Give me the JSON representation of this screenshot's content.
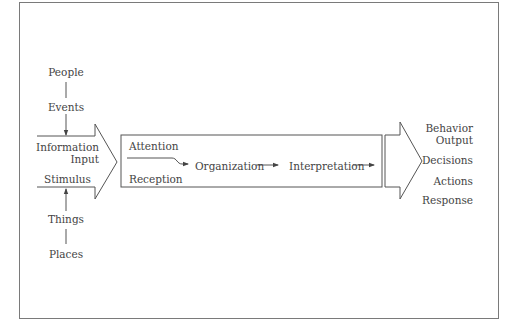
{
  "diagram": {
    "type": "perception-process-flow",
    "inputs": {
      "top_sources": [
        "People",
        "Events"
      ],
      "bottom_sources": [
        "Things",
        "Places"
      ],
      "arrow_labels": [
        "Information",
        "Input",
        "Stimulus"
      ]
    },
    "process": {
      "stages": [
        "Attention",
        "Reception",
        "Organization",
        "Interpretation"
      ]
    },
    "outputs": {
      "labels": [
        "Behavior",
        "Output",
        "Decisions",
        "Actions",
        "Response"
      ]
    },
    "colors": {
      "stroke": "#555555",
      "frame": "#7a7a7a",
      "text": "#444444",
      "background": "#ffffff"
    }
  }
}
